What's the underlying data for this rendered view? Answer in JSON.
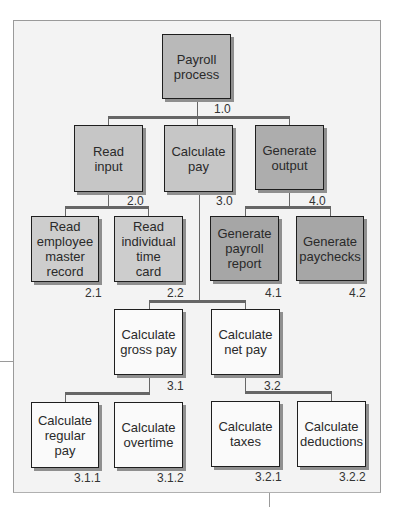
{
  "diagram": {
    "type": "hierarchy chart",
    "nodes": [
      {
        "id": "1.0",
        "label": "Payroll\nprocess",
        "level": 0
      },
      {
        "id": "2.0",
        "label": "Read\ninput",
        "level": 1,
        "parent": "1.0"
      },
      {
        "id": "3.0",
        "label": "Calculate\npay",
        "level": 1,
        "parent": "1.0"
      },
      {
        "id": "4.0",
        "label": "Generate\noutput",
        "level": 1,
        "parent": "1.0"
      },
      {
        "id": "2.1",
        "label": "Read\nemployee\nmaster\nrecord",
        "level": 2,
        "parent": "2.0"
      },
      {
        "id": "2.2",
        "label": "Read\nindividual\ntime\ncard",
        "level": 2,
        "parent": "2.0"
      },
      {
        "id": "4.1",
        "label": "Generate\npayroll\nreport",
        "level": 2,
        "parent": "4.0"
      },
      {
        "id": "4.2",
        "label": "Generate\npaychecks",
        "level": 2,
        "parent": "4.0"
      },
      {
        "id": "3.1",
        "label": "Calculate\ngross pay",
        "level": 2,
        "parent": "3.0"
      },
      {
        "id": "3.2",
        "label": "Calculate\nnet pay",
        "level": 2,
        "parent": "3.0"
      },
      {
        "id": "3.1.1",
        "label": "Calculate\nregular\npay",
        "level": 3,
        "parent": "3.1"
      },
      {
        "id": "3.1.2",
        "label": "Calculate\novertime",
        "level": 3,
        "parent": "3.1"
      },
      {
        "id": "3.2.1",
        "label": "Calculate\ntaxes",
        "level": 3,
        "parent": "3.2"
      },
      {
        "id": "3.2.2",
        "label": "Calculate\ndeductions",
        "level": 3,
        "parent": "3.2"
      }
    ]
  },
  "colors": {
    "panel": "#f3f3f3",
    "level0": "#b9b9b9",
    "input_branch": "#c6c6c6",
    "output_branch": "#adadad",
    "calc_branch": "#fafafa",
    "border": "#1e1e1e"
  }
}
